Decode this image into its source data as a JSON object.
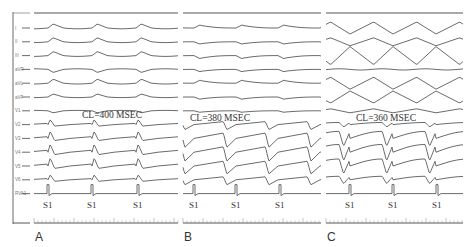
{
  "figure": {
    "leads": [
      "I",
      "II",
      "III",
      "aVR",
      "aVL",
      "aVF",
      "V1",
      "V2",
      "V3",
      "V4",
      "V5",
      "V6",
      "RVA1"
    ],
    "panels": [
      {
        "label": "A",
        "cycle_length": "CL=400 MSEC",
        "stim_label": "S1",
        "stim_count": 3
      },
      {
        "label": "B",
        "cycle_length": "CL=380 MSEC",
        "stim_label": "S1",
        "stim_count": 3
      },
      {
        "label": "C",
        "cycle_length": "CL=360 MSEC",
        "stim_label": "S1",
        "stim_count": 3
      }
    ]
  }
}
